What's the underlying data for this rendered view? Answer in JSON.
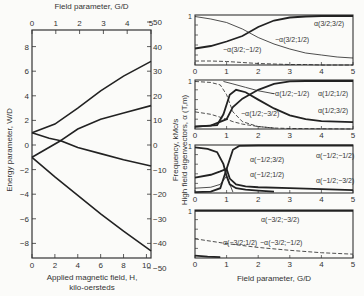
{
  "chart_data": [
    {
      "type": "line",
      "title": "",
      "top_xlabel": "Field parameter, G/D",
      "top_xticks": [
        "0",
        "1",
        "2",
        "3",
        "4",
        "5"
      ],
      "xlabel_line1": "Applied magnetic field, H,",
      "xlabel_line2": "kilo-oersteds",
      "xticks": [
        "0",
        "2",
        "4",
        "6",
        "8",
        "10"
      ],
      "xlim": [
        0,
        10.4
      ],
      "ylabel": "Energy parameter,  W/D",
      "yticks": [
        "8",
        "6",
        "4",
        "2",
        "0",
        "-2",
        "-4",
        "-6",
        "-8"
      ],
      "ylim": [
        -9.2,
        9.2
      ],
      "right_ylabel": "Frequency,  kMc/s",
      "right_yticks": [
        "50",
        "40",
        "30",
        "20",
        "10",
        "0",
        "-10",
        "-20",
        "-30",
        "-40",
        "-50"
      ],
      "grid": false,
      "series": [
        {
          "name": "upper branch A",
          "x": [
            0,
            2,
            4,
            6,
            8,
            10.4
          ],
          "values": [
            1.0,
            1.7,
            3.0,
            4.4,
            5.6,
            6.8
          ]
        },
        {
          "name": "upper branch B",
          "x": [
            0,
            1.5,
            2.5,
            4,
            6,
            8,
            10.4
          ],
          "values": [
            1.0,
            0.55,
            0.35,
            1.3,
            2.1,
            2.6,
            3.2
          ]
        },
        {
          "name": "middle branch",
          "x": [
            0,
            2.5,
            4,
            6,
            8,
            10.4
          ],
          "values": [
            -1.0,
            0.35,
            -0.2,
            -0.7,
            -1.2,
            -1.7
          ]
        },
        {
          "name": "lower branch",
          "x": [
            0,
            2,
            4,
            6,
            8,
            10.4
          ],
          "values": [
            -1.0,
            -2.6,
            -4.1,
            -5.6,
            -7.0,
            -8.6
          ]
        }
      ]
    },
    {
      "type": "line",
      "panel": 1,
      "xlim": [
        0,
        5
      ],
      "ylim": [
        0,
        1
      ],
      "xticks": [
        "0",
        "1",
        "2",
        "3",
        "4",
        "5"
      ],
      "yticks": [
        "1",
        "0"
      ],
      "x": [
        0,
        0.5,
        1,
        1.5,
        2,
        2.5,
        3,
        3.5,
        4,
        4.5,
        5
      ],
      "series": [
        {
          "name": "α(3/2;3/2)",
          "values": [
            0.33,
            0.38,
            0.47,
            0.58,
            0.76,
            0.89,
            0.95,
            0.97,
            0.98,
            0.98,
            0.98
          ],
          "style": "bold"
        },
        {
          "name": "α(3/2;1/2)",
          "values": [
            0.97,
            0.92,
            0.85,
            0.72,
            0.55,
            0.42,
            0.32,
            0.24,
            0.2,
            0.16,
            0.14
          ],
          "style": "thin"
        },
        {
          "name": "α(3/2;-1/2)",
          "values": [
            0.08,
            0.08,
            0.07,
            0.05,
            0.03,
            0.02,
            0.01,
            0.01,
            0.0,
            0.0,
            0.0
          ],
          "style": "dashed"
        }
      ]
    },
    {
      "type": "line",
      "panel": 2,
      "xlim": [
        0,
        5
      ],
      "ylim": [
        0,
        1
      ],
      "xticks": [
        "0",
        "1",
        "2",
        "3",
        "4",
        "5"
      ],
      "yticks": [
        "1",
        "0"
      ],
      "series": [
        {
          "name": "α(1/2;1/2)",
          "x": [
            0,
            0.5,
            1,
            1.2,
            1.5,
            2,
            2.5,
            3,
            3.5,
            4,
            5
          ],
          "values": [
            0.05,
            0.07,
            0.2,
            0.45,
            0.62,
            0.8,
            0.92,
            0.97,
            0.98,
            0.98,
            0.98
          ],
          "style": "bold"
        },
        {
          "name": "α(1/2;3/2)",
          "x": [
            0,
            0.7,
            0.9,
            1.1,
            1.3,
            1.6,
            2,
            2.5,
            3,
            3.5,
            4,
            5
          ],
          "values": [
            0.05,
            0.08,
            0.3,
            0.7,
            0.8,
            0.75,
            0.6,
            0.42,
            0.28,
            0.2,
            0.16,
            0.14
          ],
          "style": "bold"
        },
        {
          "name": "α(1/2;-1/2)",
          "x": [
            0,
            0.5,
            0.8,
            1.0,
            1.2,
            1.5,
            2,
            2.5,
            3,
            5
          ],
          "values": [
            0.97,
            0.95,
            0.9,
            0.7,
            0.35,
            0.15,
            0.05,
            0.02,
            0.01,
            0.0
          ],
          "style": "dashed"
        },
        {
          "name": "α(1/2;-3/2)",
          "x": [
            0,
            0.5,
            1,
            1.2,
            1.5,
            2,
            2.5
          ],
          "values": [
            0.35,
            0.3,
            0.2,
            0.15,
            0.1,
            0.05,
            0.02
          ],
          "style": "dashed"
        },
        {
          "name": "α(1/2;-1/2) outer",
          "x": [
            0.9,
            1.2,
            1.6,
            2,
            2.5
          ],
          "values": [
            0.97,
            0.92,
            0.85,
            0.78,
            0.72
          ],
          "style": "thin"
        }
      ]
    },
    {
      "type": "line",
      "panel": 3,
      "xlim": [
        0,
        5
      ],
      "ylim": [
        0,
        1
      ],
      "xticks": [
        "0",
        "1",
        "2",
        "3",
        "4",
        "5"
      ],
      "yticks": [
        "1",
        "0"
      ],
      "series": [
        {
          "name": "α(-1/2;-1/2)",
          "x": [
            0,
            0.5,
            0.8,
            1.0,
            1.2,
            1.4,
            2,
            3,
            5
          ],
          "values": [
            0.02,
            0.03,
            0.1,
            0.5,
            0.9,
            0.98,
            0.99,
            0.99,
            0.99
          ],
          "style": "bold"
        },
        {
          "name": "α(-1/2;3/2)",
          "x": [
            0,
            0.4,
            0.7,
            0.9,
            1.0,
            1.1,
            1.3,
            1.6,
            2,
            2.5
          ],
          "values": [
            0.95,
            0.92,
            0.85,
            0.6,
            0.35,
            0.18,
            0.1,
            0.07,
            0.05,
            0.03
          ],
          "style": "bold"
        },
        {
          "name": "α(-1/2;1/2)",
          "x": [
            0,
            0.5,
            0.8,
            1.0,
            1.1,
            1.3,
            1.6,
            2,
            3,
            4,
            5
          ],
          "values": [
            0.32,
            0.38,
            0.45,
            0.5,
            0.3,
            0.18,
            0.14,
            0.12,
            0.1,
            0.08,
            0.06
          ],
          "style": "bold"
        },
        {
          "name": "α(-1/2;-3/2)",
          "x": [
            0,
            0.5,
            0.8,
            1.0,
            1.2
          ],
          "values": [
            0.1,
            0.12,
            0.18,
            0.35,
            0.02
          ],
          "style": "thin"
        }
      ]
    },
    {
      "type": "line",
      "panel": 4,
      "xlabel": "Field parameter, G/D",
      "xlim": [
        0,
        5
      ],
      "ylim": [
        0,
        1
      ],
      "xticks": [
        "0",
        "1",
        "2",
        "3",
        "4",
        "5"
      ],
      "yticks": [
        "1",
        "0"
      ],
      "series": [
        {
          "name": "α(-3/2;-3/2)",
          "x": [
            0,
            5
          ],
          "values": [
            0.98,
            0.98
          ],
          "style": "bold"
        },
        {
          "name": "α(-3/2;-1/2)",
          "x": [
            0,
            1,
            2,
            3,
            4,
            5
          ],
          "values": [
            0.4,
            0.3,
            0.22,
            0.16,
            0.11,
            0.08
          ],
          "style": "dashed"
        },
        {
          "name": "α(-3/2;1/2)",
          "x": [
            0,
            0.4,
            0.8
          ],
          "values": [
            0.05,
            0.03,
            0.02
          ],
          "style": "bold"
        }
      ]
    }
  ],
  "shared_right_ylabel": "High field eigenvectors, α (T,m)",
  "labels": {
    "p1": [
      {
        "text": "α(3/2;3/2)",
        "x": 314,
        "y": 26
      },
      {
        "text": "−α(3/2;1/2)",
        "x": 275,
        "y": 42
      },
      {
        "text": "−α(3/2;−1/2)",
        "x": 223,
        "y": 52
      }
    ],
    "p2": [
      {
        "text": "−α(1/2;−1/2)",
        "x": 271,
        "y": 96
      },
      {
        "text": "α(1/2;1/2)",
        "x": 318,
        "y": 96
      },
      {
        "text": "α(1/2;3/2)",
        "x": 318,
        "y": 113
      },
      {
        "text": "−α(1/2;−3/2)",
        "x": 241,
        "y": 116
      }
    ],
    "p3": [
      {
        "text": "α(−1/2;3/2)",
        "x": 250,
        "y": 162
      },
      {
        "text": "α(−1/2;1/2)",
        "x": 250,
        "y": 177
      },
      {
        "text": "α(−1/2;−1/2)",
        "x": 316,
        "y": 158
      },
      {
        "text": "α(−1/2;−3/2)",
        "x": 316,
        "y": 183
      }
    ],
    "p4": [
      {
        "text": "α(−3/2;−3/2)",
        "x": 261,
        "y": 222
      },
      {
        "text": "α(−3/2;1/2)",
        "x": 223,
        "y": 245
      },
      {
        "text": "−α(−3/2;−1/2)",
        "x": 260,
        "y": 245
      }
    ]
  }
}
